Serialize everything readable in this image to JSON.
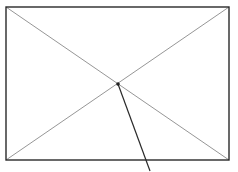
{
  "canvas": {
    "width": 238,
    "height": 172,
    "background": "#ffffff"
  },
  "rectangle": {
    "x1": 6,
    "y1": 7,
    "x2": 229,
    "y2": 160,
    "stroke": "#2a2a2a",
    "stroke_width": 1.4
  },
  "diagonals": [
    {
      "x1": 6,
      "y1": 7,
      "x2": 229,
      "y2": 160,
      "stroke": "#8a8a8a",
      "stroke_width": 0.9
    },
    {
      "x1": 229,
      "y1": 7,
      "x2": 6,
      "y2": 160,
      "stroke": "#8a8a8a",
      "stroke_width": 0.9
    }
  ],
  "center_point": {
    "cx": 118,
    "cy": 84,
    "r": 1.8,
    "fill": "#222222"
  },
  "pointer_line": {
    "x1": 118,
    "y1": 84,
    "x2": 150,
    "y2": 171,
    "stroke": "#2a2a2a",
    "stroke_width": 1.2
  }
}
